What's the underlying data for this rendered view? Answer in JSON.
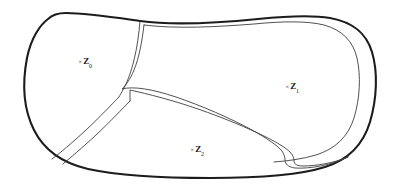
{
  "figure": {
    "kind": "hand-drawn-region-partition-diagram",
    "background_color": "#ffffff",
    "outer_outline_color": "#1c1c1c",
    "inner_boundary_color": "#3d3d3d",
    "outer_stroke_width": 2.1,
    "inner_stroke_width": 0.9
  },
  "regions": [
    {
      "id": "z0",
      "name": "left-region",
      "prefix": "×",
      "symbol": "Z",
      "subscript": "0",
      "label_text": "×Z0"
    },
    {
      "id": "z1",
      "name": "right-region",
      "prefix": "×",
      "symbol": "Z",
      "subscript": "1",
      "label_text": "×Z1"
    },
    {
      "id": "z2",
      "name": "bottom-region",
      "prefix": "×",
      "symbol": "Z",
      "subscript": "2",
      "label_text": "×Z2"
    }
  ]
}
